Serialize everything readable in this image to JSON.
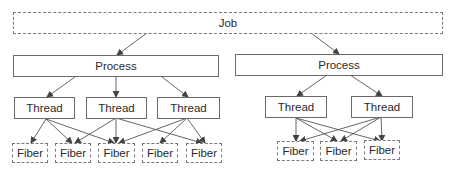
{
  "diagram": {
    "job": {
      "label": "Job"
    },
    "processes": [
      {
        "label": "Process",
        "threads": [
          {
            "label": "Thread"
          },
          {
            "label": "Thread"
          },
          {
            "label": "Thread"
          }
        ],
        "fibers": [
          {
            "label": "Fiber"
          },
          {
            "label": "Fiber"
          },
          {
            "label": "Fiber"
          },
          {
            "label": "Fiber"
          },
          {
            "label": "Fiber"
          }
        ],
        "thread_fiber_links": [
          [
            0,
            0
          ],
          [
            0,
            1
          ],
          [
            0,
            2
          ],
          [
            1,
            1
          ],
          [
            1,
            2
          ],
          [
            1,
            4
          ],
          [
            2,
            2
          ],
          [
            2,
            3
          ],
          [
            2,
            4
          ]
        ]
      },
      {
        "label": "Process",
        "threads": [
          {
            "label": "Thread"
          },
          {
            "label": "Thread"
          }
        ],
        "fibers": [
          {
            "label": "Fiber"
          },
          {
            "label": "Fiber"
          },
          {
            "label": "Fiber"
          }
        ],
        "thread_fiber_links": [
          [
            0,
            0
          ],
          [
            0,
            1
          ],
          [
            0,
            2
          ],
          [
            1,
            0
          ],
          [
            1,
            1
          ],
          [
            1,
            2
          ]
        ]
      }
    ],
    "colors": {
      "line": "#555555",
      "text": "#2a2a2a"
    }
  }
}
